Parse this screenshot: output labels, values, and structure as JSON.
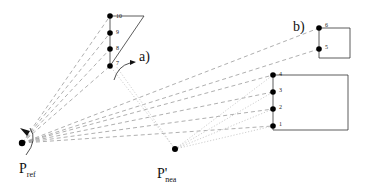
{
  "diagram": {
    "labels": {
      "a": "a)",
      "b": "b)",
      "p_ref_main": "P",
      "p_ref_sub": "ref",
      "p_nea_main": "P'",
      "p_nea_sub": "nea"
    },
    "points": {
      "group_a": [
        "10",
        "9",
        "8",
        "7"
      ],
      "group_b_top": [
        "6",
        "5"
      ],
      "group_b_bottom": [
        "4",
        "3",
        "2",
        "1"
      ]
    },
    "colors": {
      "stroke": "#333333",
      "ray": "#9a9a9a",
      "ray_light": "#c8c8c8",
      "dot": "#000000"
    }
  }
}
